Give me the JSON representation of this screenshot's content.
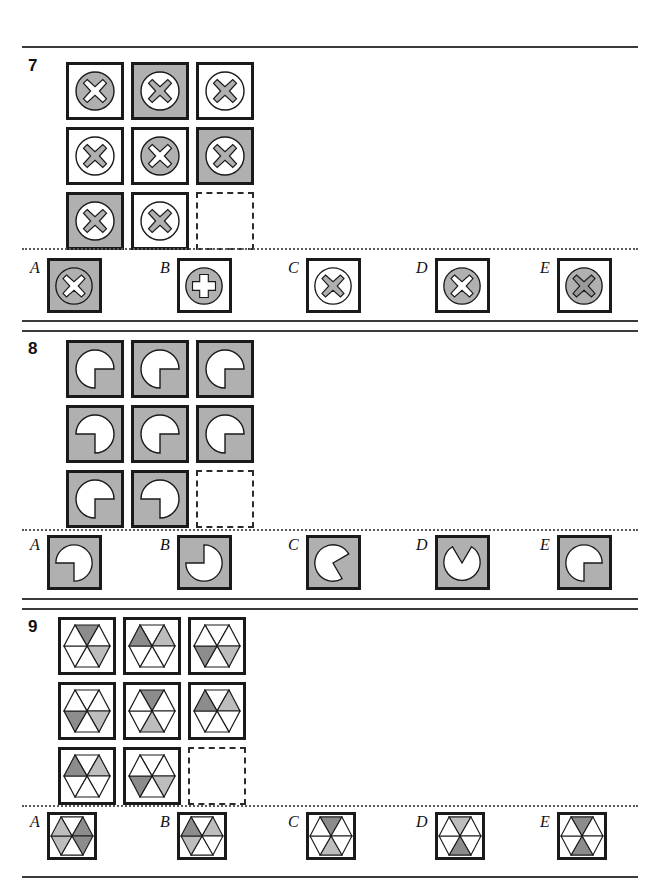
{
  "page": {
    "colors": {
      "gray_fill": "#b0b0b0",
      "dark_gray": "#8c8c8c",
      "light_gray": "#bdbdbd",
      "white": "#ffffff",
      "stroke": "#1a1a1a"
    }
  },
  "puzzles": [
    {
      "number": "7",
      "shape_type": "circle-with-cross",
      "matrix": [
        {
          "pos": "r1c1",
          "bg": "white",
          "circle": "gray",
          "mark": "white",
          "mark_type": "x"
        },
        {
          "pos": "r1c2",
          "bg": "gray",
          "circle": "white",
          "mark": "gray",
          "mark_type": "x"
        },
        {
          "pos": "r1c3",
          "bg": "white",
          "circle": "white",
          "mark": "gray",
          "mark_type": "x"
        },
        {
          "pos": "r2c1",
          "bg": "white",
          "circle": "white",
          "mark": "gray",
          "mark_type": "x"
        },
        {
          "pos": "r2c2",
          "bg": "white",
          "circle": "gray",
          "mark": "white",
          "mark_type": "x"
        },
        {
          "pos": "r2c3",
          "bg": "gray",
          "circle": "white",
          "mark": "gray",
          "mark_type": "x"
        },
        {
          "pos": "r3c1",
          "bg": "gray",
          "circle": "white",
          "mark": "gray",
          "mark_type": "x"
        },
        {
          "pos": "r3c2",
          "bg": "white",
          "circle": "white",
          "mark": "gray",
          "mark_type": "x"
        },
        {
          "pos": "r3c3",
          "bg": "blank",
          "circle": "none",
          "mark": "none",
          "mark_type": "none"
        }
      ],
      "options": [
        {
          "letter": "A",
          "bg": "gray",
          "circle": "gray",
          "mark": "white",
          "mark_type": "x"
        },
        {
          "letter": "B",
          "bg": "white",
          "circle": "gray",
          "mark": "white",
          "mark_type": "plus"
        },
        {
          "letter": "C",
          "bg": "white",
          "circle": "white",
          "mark": "gray",
          "mark_type": "x"
        },
        {
          "letter": "D",
          "bg": "white",
          "circle": "gray",
          "mark": "white",
          "mark_type": "x"
        },
        {
          "letter": "E",
          "bg": "white",
          "circle": "gray",
          "mark": "gray",
          "mark_type": "x"
        }
      ]
    },
    {
      "number": "8",
      "shape_type": "pacman-disc",
      "matrix": [
        {
          "pos": "r1c1",
          "bg": "gray",
          "notch": "bottom-right",
          "notch_size": "quarter"
        },
        {
          "pos": "r1c2",
          "bg": "gray",
          "notch": "bottom-right",
          "notch_size": "quarter"
        },
        {
          "pos": "r1c3",
          "bg": "gray",
          "notch": "bottom-right",
          "notch_size": "quarter"
        },
        {
          "pos": "r2c1",
          "bg": "gray",
          "notch": "bottom-left",
          "notch_size": "quarter"
        },
        {
          "pos": "r2c2",
          "bg": "gray",
          "notch": "bottom-right",
          "notch_size": "quarter"
        },
        {
          "pos": "r2c3",
          "bg": "gray",
          "notch": "bottom-right",
          "notch_size": "quarter"
        },
        {
          "pos": "r3c1",
          "bg": "gray",
          "notch": "bottom-right",
          "notch_size": "quarter"
        },
        {
          "pos": "r3c2",
          "bg": "gray",
          "notch": "bottom-left",
          "notch_size": "quarter"
        },
        {
          "pos": "r3c3",
          "bg": "blank",
          "notch": "none",
          "notch_size": "none"
        }
      ],
      "options": [
        {
          "letter": "A",
          "bg": "gray",
          "notch": "bottom-left",
          "notch_size": "quarter"
        },
        {
          "letter": "B",
          "bg": "gray",
          "notch": "top-right",
          "notch_size": "quarter"
        },
        {
          "letter": "C",
          "bg": "gray",
          "notch": "right",
          "notch_size": "quarter"
        },
        {
          "letter": "D",
          "bg": "gray",
          "notch": "top-center",
          "notch_size": "wedge"
        },
        {
          "letter": "E",
          "bg": "gray",
          "notch": "bottom-right",
          "notch_size": "quarter"
        }
      ]
    },
    {
      "number": "9",
      "shape_type": "hexagon-six-sectors",
      "sector_order": "top, top-right, bottom-right, bottom, bottom-left, top-left",
      "matrix": [
        {
          "pos": "r1c1",
          "bg": "white",
          "sectors": [
            "dark",
            "white",
            "light",
            "white",
            "white",
            "white"
          ]
        },
        {
          "pos": "r1c2",
          "bg": "white",
          "sectors": [
            "white",
            "light",
            "white",
            "white",
            "white",
            "dark"
          ]
        },
        {
          "pos": "r1c3",
          "bg": "white",
          "sectors": [
            "white",
            "white",
            "light",
            "white",
            "dark",
            "white"
          ]
        },
        {
          "pos": "r2c1",
          "bg": "white",
          "sectors": [
            "white",
            "white",
            "light",
            "white",
            "dark",
            "white"
          ]
        },
        {
          "pos": "r2c2",
          "bg": "white",
          "sectors": [
            "dark",
            "white",
            "white",
            "light",
            "white",
            "white"
          ]
        },
        {
          "pos": "r2c3",
          "bg": "white",
          "sectors": [
            "white",
            "light",
            "white",
            "white",
            "white",
            "dark"
          ]
        },
        {
          "pos": "r3c1",
          "bg": "white",
          "sectors": [
            "white",
            "light",
            "white",
            "white",
            "white",
            "dark"
          ]
        },
        {
          "pos": "r3c2",
          "bg": "white",
          "sectors": [
            "white",
            "white",
            "light",
            "white",
            "dark",
            "white"
          ]
        },
        {
          "pos": "r3c3",
          "bg": "blank",
          "sectors": []
        }
      ],
      "options": [
        {
          "letter": "A",
          "bg": "white",
          "sectors": [
            "white",
            "dark",
            "dark",
            "white",
            "light",
            "light"
          ]
        },
        {
          "letter": "B",
          "bg": "white",
          "sectors": [
            "white",
            "light",
            "white",
            "white",
            "light",
            "dark"
          ]
        },
        {
          "letter": "C",
          "bg": "white",
          "sectors": [
            "dark",
            "white",
            "white",
            "light",
            "white",
            "white"
          ]
        },
        {
          "letter": "D",
          "bg": "white",
          "sectors": [
            "light",
            "white",
            "white",
            "dark",
            "white",
            "white"
          ]
        },
        {
          "letter": "E",
          "bg": "white",
          "sectors": [
            "dark",
            "white",
            "white",
            "dark",
            "white",
            "white"
          ]
        }
      ]
    }
  ]
}
